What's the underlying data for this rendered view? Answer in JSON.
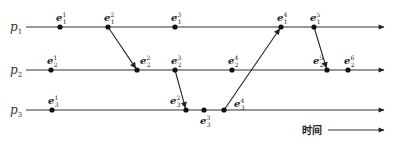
{
  "diagram": {
    "type": "space-time diagram",
    "processes": [
      {
        "id": "p1",
        "name": "p",
        "sub": "1"
      },
      {
        "id": "p2",
        "name": "p",
        "sub": "2"
      },
      {
        "id": "p3",
        "name": "p",
        "sub": "3"
      }
    ],
    "events": [
      {
        "id": "e1_1",
        "process": "p1",
        "base": "e",
        "sub": "1",
        "sup": "1"
      },
      {
        "id": "e1_2",
        "process": "p1",
        "base": "e",
        "sub": "1",
        "sup": "2"
      },
      {
        "id": "e1_3",
        "process": "p1",
        "base": "e",
        "sub": "1",
        "sup": "3"
      },
      {
        "id": "e1_4",
        "process": "p1",
        "base": "e",
        "sub": "1",
        "sup": "4"
      },
      {
        "id": "e1_5",
        "process": "p1",
        "base": "e",
        "sub": "1",
        "sup": "5"
      },
      {
        "id": "e2_1",
        "process": "p2",
        "base": "e",
        "sub": "2",
        "sup": "1"
      },
      {
        "id": "e2_2",
        "process": "p2",
        "base": "e",
        "sub": "2",
        "sup": "2"
      },
      {
        "id": "e2_3",
        "process": "p2",
        "base": "e",
        "sub": "2",
        "sup": "3"
      },
      {
        "id": "e2_4",
        "process": "p2",
        "base": "e",
        "sub": "2",
        "sup": "4"
      },
      {
        "id": "e2_5",
        "process": "p2",
        "base": "e",
        "sub": "2",
        "sup": "5"
      },
      {
        "id": "e2_6",
        "process": "p2",
        "base": "e",
        "sub": "2",
        "sup": "6"
      },
      {
        "id": "e3_1",
        "process": "p3",
        "base": "e",
        "sub": "3",
        "sup": "1"
      },
      {
        "id": "e3_2",
        "process": "p3",
        "base": "e",
        "sub": "3",
        "sup": "2"
      },
      {
        "id": "e3_3",
        "process": "p3",
        "base": "e",
        "sub": "3",
        "sup": "3"
      },
      {
        "id": "e3_4",
        "process": "p3",
        "base": "e",
        "sub": "3",
        "sup": "4"
      }
    ],
    "messages": [
      {
        "from": "e1_2",
        "to": "e2_2"
      },
      {
        "from": "e2_3",
        "to": "e3_2"
      },
      {
        "from": "e3_4",
        "to": "e1_4"
      },
      {
        "from": "e1_5",
        "to": "e2_5"
      }
    ],
    "time_axis_label": "时间"
  }
}
